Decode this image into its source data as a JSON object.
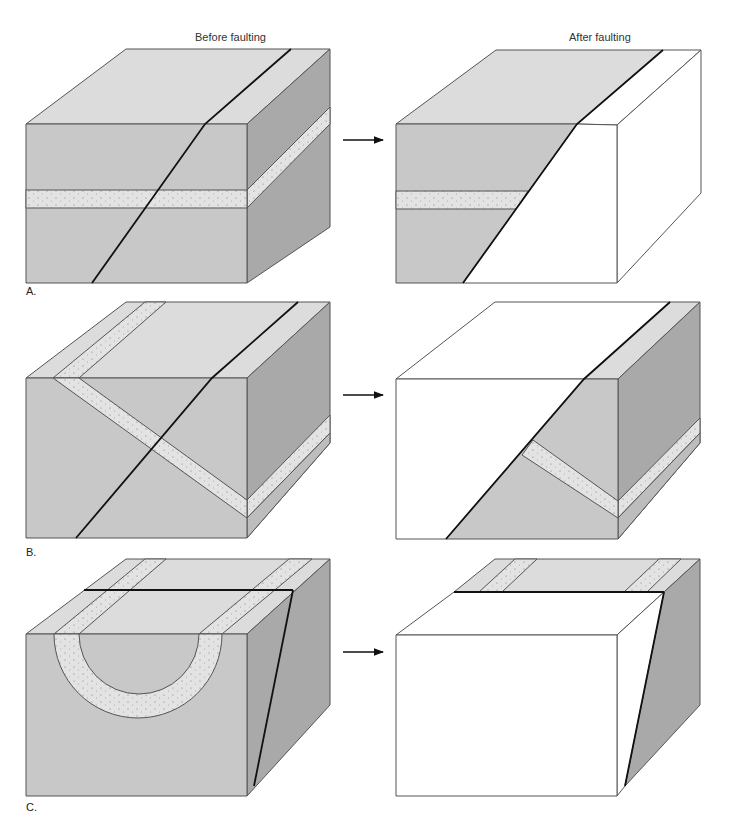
{
  "titles": {
    "before": "Before faulting",
    "after": "After faulting"
  },
  "panels": [
    {
      "label": "A.",
      "description": "Horizontal sandstone layer cut by an inclined fault"
    },
    {
      "label": "B.",
      "description": "Tilted sandstone layer cut by an inclined fault"
    },
    {
      "label": "C.",
      "description": "Folded (syncline) sandstone layer cut by a steep fault"
    }
  ],
  "colors": {
    "front": "#c8c8c8",
    "top": "#dcdcdc",
    "side": "#a9a9a9",
    "band": "#e3e3e3",
    "removed": "#ffffff",
    "outline": "#555555",
    "fault": "#111111"
  }
}
